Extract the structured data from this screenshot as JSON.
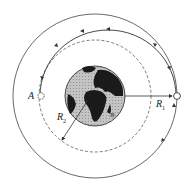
{
  "diagram": {
    "labels": {
      "point_a": "A",
      "point_b": "B",
      "r1": "R",
      "r1_sub": "1",
      "r2": "R",
      "r2_sub": "2"
    },
    "colors": {
      "line": "#333333",
      "ocean": "#bdbdbd",
      "land": "#1a1a1a",
      "background": "#ffffff"
    },
    "elements": [
      "outer-orbit-circle",
      "inner-orbit-circle-dashed",
      "transfer-orbit-arc",
      "earth",
      "radius-r1-arrow",
      "radius-r2-arrow",
      "satellite-at-A",
      "satellite-at-outer"
    ]
  }
}
